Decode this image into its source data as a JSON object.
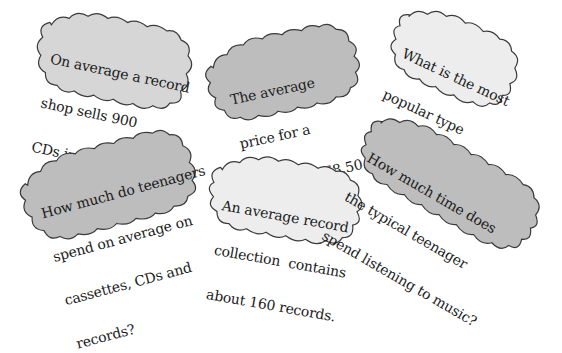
{
  "colors": {
    "dark_fill": "#bdbdbd",
    "mid_fill": "#d6d6d6",
    "light_fill": "#ededed",
    "outline": "#3a3a3a",
    "text": "#1a1a1a"
  },
  "clouds": [
    {
      "id": "shop-sells",
      "lines": [
        "On average a record",
        "shop sells 900",
        "CDs in a week."
      ],
      "shade": "mid"
    },
    {
      "id": "cassette-price",
      "lines": [
        "The average",
        "price for a",
        "cassette is £8.50."
      ],
      "shade": "dark"
    },
    {
      "id": "popular-music",
      "lines": [
        "What is the most",
        "popular type",
        "of music?"
      ],
      "shade": "light"
    },
    {
      "id": "teen-spending",
      "lines": [
        "How much do teenagers",
        "spend on average on",
        "cassettes, CDs and",
        "records?"
      ],
      "shade": "dark"
    },
    {
      "id": "record-collection",
      "lines": [
        "An average record",
        "collection  contains",
        "about 160 records."
      ],
      "shade": "light"
    },
    {
      "id": "listening-time",
      "lines": [
        "How much time does",
        "the typical teenager",
        "spend listening to music?"
      ],
      "shade": "dark"
    }
  ]
}
